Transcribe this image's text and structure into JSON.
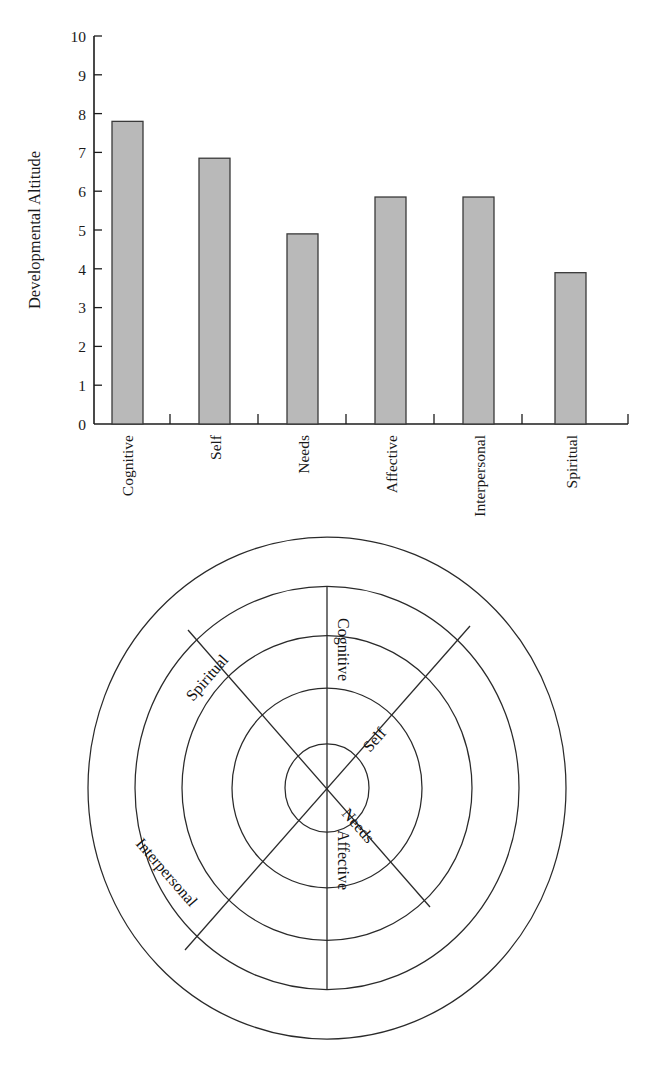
{
  "figure": {
    "title": "",
    "panels": [
      {
        "name": "bar-chart-panel",
        "label": "Bar chart of developmental altitude by line"
      },
      {
        "name": "concentric-circles-panel",
        "label": "Concentric circles diagram of developmental lines"
      }
    ]
  },
  "chart_data": [
    {
      "type": "bar",
      "title": "",
      "xlabel": "",
      "ylabel": "Developmental Altitude",
      "categories": [
        "Cognitive",
        "Self",
        "Needs",
        "Affective",
        "Interpersonal",
        "Spiritual"
      ],
      "values": [
        7.8,
        6.85,
        4.9,
        5.85,
        5.85,
        3.9
      ],
      "ylim": [
        0,
        10
      ],
      "ytick_labels": [
        "0",
        "1",
        "2",
        "3",
        "4",
        "5",
        "6",
        "7",
        "8",
        "9",
        "10"
      ],
      "ytick_values": [
        0,
        1,
        2,
        3,
        4,
        5,
        6,
        7,
        8,
        9,
        10
      ],
      "grid": false,
      "legend": "none",
      "bar_color": "#b9b9b9",
      "bar_edge_color": "#3a3a3a",
      "axis_color": "#1c1c1c",
      "category_label_rotation": -90
    },
    {
      "type": "radial-diagram",
      "title": "",
      "rings": 5,
      "ring_radii": [
        42,
        95,
        145,
        192,
        239
      ],
      "spokes": [
        {
          "label": "Cognitive",
          "angle_deg": 90
        },
        {
          "label": "Self",
          "angle_deg": 45
        },
        {
          "label": "Needs",
          "angle_deg": -45
        },
        {
          "label": "Affective",
          "angle_deg": -90
        },
        {
          "label": "Interpersonal",
          "angle_deg": 225
        },
        {
          "label": "Spiritual",
          "angle_deg": 135
        }
      ],
      "labels": [
        "Cognitive",
        "Self",
        "Needs",
        "Affective",
        "Interpersonal",
        "Spiritual"
      ],
      "stroke_color": "#2a2a2a"
    }
  ],
  "bar_chart": {
    "y_axis_title": "Developmental Altitude",
    "y_ticks": [
      "10",
      "9",
      "8",
      "7",
      "6",
      "5",
      "4",
      "3",
      "2",
      "1",
      "0"
    ],
    "bars": [
      {
        "label": "Cognitive",
        "value": 7.8
      },
      {
        "label": "Self",
        "value": 6.85
      },
      {
        "label": "Needs",
        "value": 4.9
      },
      {
        "label": "Affective",
        "value": 5.85
      },
      {
        "label": "Interpersonal",
        "value": 5.85
      },
      {
        "label": "Spiritual",
        "value": 3.9
      }
    ]
  },
  "circles_diagram": {
    "spoke_labels": {
      "cognitive": "Cognitive",
      "self": "Self",
      "needs": "Needs",
      "affective": "Affective",
      "interpersonal": "Interpersonal",
      "spiritual": "Spiritual"
    }
  }
}
